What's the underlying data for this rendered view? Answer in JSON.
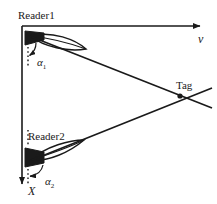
{
  "figure": {
    "background_color": "#ffffff",
    "stroke_color": "#1a1a1a"
  },
  "axes": {
    "vertical": {
      "label": "X",
      "direction": "down",
      "arrowhead": true
    },
    "horizontal": {
      "label": "v",
      "direction": "right",
      "arrowhead": true
    }
  },
  "nodes": [
    {
      "id": "reader1",
      "label": "Reader1",
      "icon": "antenna-icon"
    },
    {
      "id": "reader2",
      "label": "Reader2",
      "icon": "antenna-icon"
    },
    {
      "id": "tag",
      "label": "Tag",
      "icon": "tag-point-icon"
    }
  ],
  "angles": [
    {
      "id": "alpha1",
      "symbol": "α",
      "subscript": "1",
      "at": "reader1"
    },
    {
      "id": "alpha2",
      "symbol": "α",
      "subscript": "2",
      "at": "reader2"
    }
  ],
  "beams": [
    {
      "from": "reader1",
      "to": "tag"
    },
    {
      "from": "reader2",
      "to": "tag"
    }
  ]
}
